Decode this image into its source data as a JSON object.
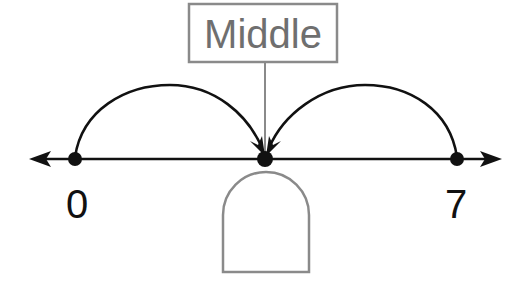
{
  "diagram": {
    "type": "number-line-midpoint",
    "title_box": {
      "label": "Middle"
    },
    "number_line": {
      "start_label": "0",
      "end_label": "7",
      "start_value": 0,
      "end_value": 7
    },
    "answer_box": {
      "value": ""
    },
    "colors": {
      "line": "#111111",
      "box_stroke": "#8a8a8a",
      "box_text": "#6f6f6f",
      "background": "#ffffff"
    }
  }
}
